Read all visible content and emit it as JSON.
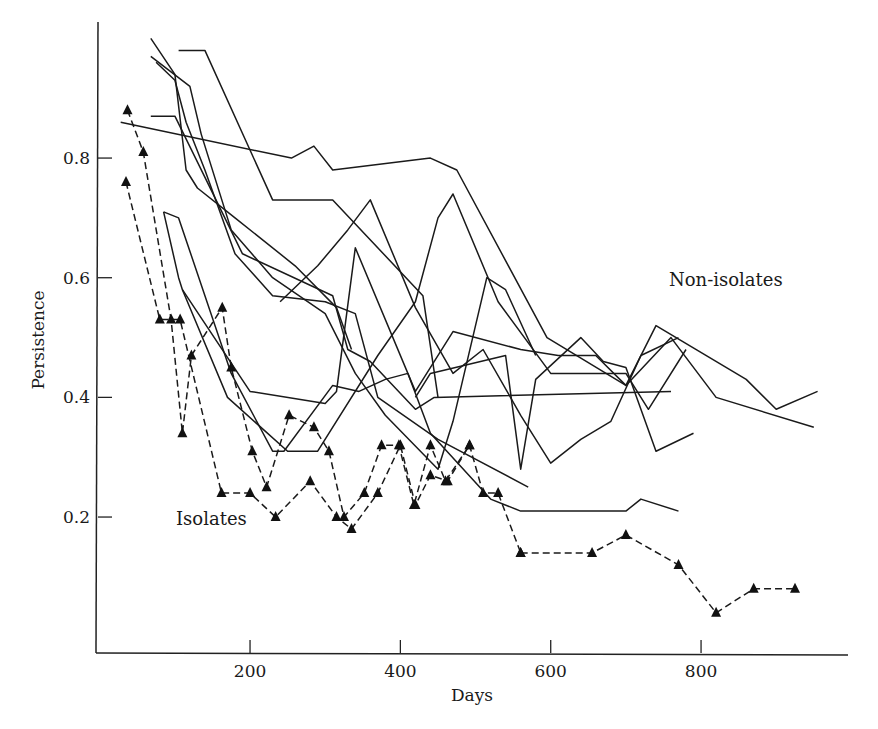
{
  "chart_data": {
    "type": "line",
    "title": "",
    "xlabel": "Days",
    "ylabel": "Persistence",
    "xlim": [
      0,
      1000
    ],
    "ylim": [
      0,
      1.0
    ],
    "x_ticks": [
      200,
      400,
      600,
      800
    ],
    "x_tick_labels": [
      "200",
      "400",
      "600",
      "800"
    ],
    "y_ticks": [
      0.2,
      0.4,
      0.6,
      0.8
    ],
    "y_tick_labels": [
      "0.2",
      "0.4",
      "0.6",
      "0.8"
    ],
    "grid": false,
    "legend": null,
    "annotations": [
      {
        "text": "Non-isolates",
        "x": 760,
        "y": 0.61
      },
      {
        "text": "Isolates",
        "x": 95,
        "y": 0.195
      }
    ],
    "series": [
      {
        "name": "Non-isolate 1",
        "group": "Non-isolates",
        "style": "solid",
        "marker": "none",
        "x": [
          28,
          255,
          285,
          310,
          440,
          475,
          595,
          700,
          760,
          820,
          950
        ],
        "y": [
          0.86,
          0.8,
          0.82,
          0.78,
          0.8,
          0.78,
          0.5,
          0.42,
          0.5,
          0.4,
          0.35
        ]
      },
      {
        "name": "Non-isolate 2",
        "group": "Non-isolates",
        "style": "solid",
        "marker": "none",
        "x": [
          68,
          120,
          135,
          175,
          230,
          300,
          340,
          380,
          450,
          470,
          515,
          540,
          580
        ],
        "y": [
          0.97,
          0.92,
          0.84,
          0.68,
          0.6,
          0.54,
          0.44,
          0.37,
          0.28,
          0.36,
          0.6,
          0.58,
          0.47
        ]
      },
      {
        "name": "Non-isolate 3",
        "group": "Non-isolates",
        "style": "solid",
        "marker": "none",
        "x": [
          68,
          100,
          115,
          130,
          180,
          260,
          315,
          335
        ],
        "y": [
          1.0,
          0.94,
          0.78,
          0.75,
          0.7,
          0.62,
          0.55,
          0.48
        ]
      },
      {
        "name": "Non-isolate 4",
        "group": "Non-isolates",
        "style": "solid",
        "marker": "none",
        "x": [
          105,
          140,
          230,
          310,
          430,
          450
        ],
        "y": [
          0.98,
          0.98,
          0.73,
          0.73,
          0.57,
          0.4
        ]
      },
      {
        "name": "Non-isolate 5",
        "group": "Non-isolates",
        "style": "solid",
        "marker": "none",
        "x": [
          75,
          100,
          115,
          140,
          180,
          230,
          300,
          340,
          370,
          450,
          570
        ],
        "y": [
          0.96,
          0.93,
          0.86,
          0.78,
          0.64,
          0.57,
          0.56,
          0.54,
          0.4,
          0.33,
          0.25
        ]
      },
      {
        "name": "Non-isolate 6",
        "group": "Non-isolates",
        "style": "solid",
        "marker": "none",
        "x": [
          68,
          100,
          190,
          310,
          330,
          360,
          420,
          445,
          760
        ],
        "y": [
          0.87,
          0.87,
          0.64,
          0.57,
          0.48,
          0.46,
          0.38,
          0.4,
          0.41
        ]
      },
      {
        "name": "Non-isolate 7",
        "group": "Non-isolates",
        "style": "solid",
        "marker": "none",
        "x": [
          85,
          105,
          110,
          200,
          300,
          315,
          340,
          420,
          470,
          560,
          610,
          660,
          700,
          740,
          860,
          900,
          955
        ],
        "y": [
          0.71,
          0.6,
          0.58,
          0.41,
          0.39,
          0.41,
          0.65,
          0.41,
          0.51,
          0.48,
          0.47,
          0.47,
          0.42,
          0.52,
          0.43,
          0.38,
          0.41
        ]
      },
      {
        "name": "Non-isolate 8",
        "group": "Non-isolates",
        "style": "solid",
        "marker": "none",
        "x": [
          85,
          105,
          175,
          230,
          245,
          310,
          345,
          380,
          410,
          440,
          520,
          560,
          600,
          640,
          680,
          700,
          720,
          770
        ],
        "y": [
          0.71,
          0.7,
          0.44,
          0.31,
          0.31,
          0.42,
          0.41,
          0.43,
          0.44,
          0.34,
          0.23,
          0.21,
          0.21,
          0.21,
          0.21,
          0.21,
          0.23,
          0.21
        ]
      },
      {
        "name": "Non-isolate 9",
        "group": "Non-isolates",
        "style": "solid",
        "marker": "none",
        "x": [
          110,
          170,
          250,
          290,
          370,
          420,
          450,
          470,
          530,
          600,
          700,
          730,
          780
        ],
        "y": [
          0.58,
          0.4,
          0.31,
          0.31,
          0.47,
          0.56,
          0.7,
          0.74,
          0.56,
          0.44,
          0.44,
          0.38,
          0.48
        ]
      },
      {
        "name": "Non-isolate 10",
        "group": "Non-isolates",
        "style": "solid",
        "marker": "none",
        "x": [
          240,
          290,
          330,
          360,
          420,
          470,
          510,
          560,
          600,
          640,
          680,
          720,
          770
        ],
        "y": [
          0.56,
          0.62,
          0.68,
          0.73,
          0.55,
          0.44,
          0.48,
          0.37,
          0.29,
          0.33,
          0.36,
          0.47,
          0.5
        ]
      },
      {
        "name": "Non-isolate 11",
        "group": "Non-isolates",
        "style": "solid",
        "marker": "none",
        "x": [
          420,
          440,
          540,
          560,
          580,
          640,
          670,
          700,
          740,
          790
        ],
        "y": [
          0.4,
          0.44,
          0.47,
          0.28,
          0.43,
          0.5,
          0.46,
          0.45,
          0.31,
          0.34
        ]
      },
      {
        "name": "Isolate 1",
        "group": "Isolates",
        "style": "dashed",
        "marker": "triangle",
        "x": [
          35,
          80,
          107,
          162,
          200,
          234,
          280,
          315,
          335,
          370,
          400,
          420,
          440,
          463,
          492,
          510,
          530,
          560
        ],
        "y": [
          0.76,
          0.53,
          0.53,
          0.24,
          0.24,
          0.2,
          0.26,
          0.2,
          0.18,
          0.24,
          0.32,
          0.22,
          0.27,
          0.26,
          0.32,
          0.24,
          0.24,
          0.14
        ]
      },
      {
        "name": "Isolate 2",
        "group": "Isolates",
        "style": "dashed",
        "marker": "triangle",
        "x": [
          37,
          58,
          95,
          110,
          122,
          163,
          175,
          203,
          222,
          252,
          285,
          305,
          325,
          352,
          375,
          398,
          418,
          440,
          460,
          492
        ],
        "y": [
          0.88,
          0.81,
          0.53,
          0.34,
          0.47,
          0.55,
          0.45,
          0.31,
          0.25,
          0.37,
          0.35,
          0.31,
          0.2,
          0.24,
          0.32,
          0.32,
          0.22,
          0.32,
          0.26,
          0.32
        ]
      },
      {
        "name": "Isolate 3",
        "group": "Isolates",
        "style": "dashed",
        "marker": "triangle",
        "x": [
          560,
          655,
          700,
          770,
          820,
          870,
          925
        ],
        "y": [
          0.14,
          0.14,
          0.17,
          0.12,
          0.04,
          0.08,
          0.08
        ]
      }
    ]
  },
  "labels": {
    "xlabel": "Days",
    "ylabel": "Persistence",
    "non_isolates": "Non-isolates",
    "isolates": "Isolates"
  }
}
